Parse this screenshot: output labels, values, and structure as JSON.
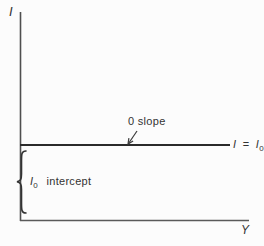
{
  "figure": {
    "background_color": "#fcfcfc",
    "axis_color": "#4f4f4f",
    "line_color": "#2b2b2b",
    "text_color": "#333333",
    "y_axis_label": "I",
    "x_axis_label": "Y",
    "line_label": {
      "lhs": "I",
      "eq": "=",
      "rhs_base": "I",
      "rhs_sub": "0"
    },
    "slope_annotation": "0 slope",
    "intercept_annotation": {
      "base": "I",
      "sub": "0",
      "word": "intercept"
    },
    "description": {
      "plotted_line": "horizontal line at I = I0 from y-axis to right side",
      "brace": "left curly brace spanning from x-axis up to the I = I0 line"
    }
  }
}
